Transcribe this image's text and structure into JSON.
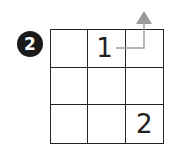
{
  "step_badge": "2",
  "grid": {
    "rows": 3,
    "cols": 3,
    "cells": [
      [
        "",
        "1",
        ""
      ],
      [
        "",
        "",
        ""
      ],
      [
        "",
        "",
        "2"
      ]
    ]
  },
  "arrow": {
    "from_cell": "row 0, col 1",
    "direction": "up",
    "color": "#a0a0a0"
  },
  "colors": {
    "grid_line": "#222222",
    "badge_bg": "#1a1a1a",
    "badge_text": "#ffffff"
  }
}
